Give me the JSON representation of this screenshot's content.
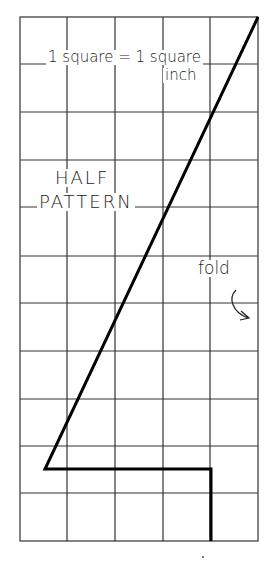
{
  "diagram": {
    "scale_label_line1": "1 square = 1 square",
    "scale_label_line2": "inch",
    "title_line1": "HALF",
    "title_line2": "PATTERN",
    "fold_label": "fold",
    "grid": {
      "columns": 5,
      "rows": 11,
      "cell_size_inches": 1,
      "line_color": "#333333"
    },
    "pattern_outline": {
      "color": "#000000",
      "points_in_squares": [
        [
          5,
          0
        ],
        [
          0.6,
          9.4
        ],
        [
          4,
          9.4
        ],
        [
          4,
          11
        ]
      ]
    }
  }
}
